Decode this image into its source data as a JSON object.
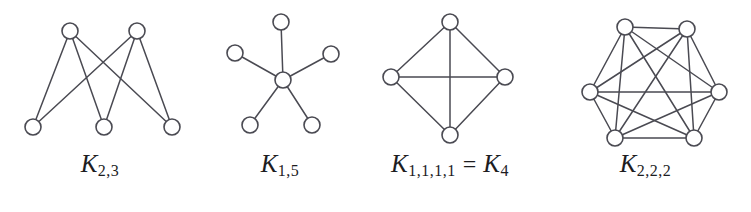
{
  "figure": {
    "background_color": "#ffffff",
    "stroke_color": "#4a4a52",
    "vertex_fill": "#ffffff",
    "label_color": "#1d1d1f",
    "graphs": [
      {
        "id": "k-2-3",
        "name": "complete-bipartite-2-3",
        "label_main": "K",
        "label_sub": "2,3",
        "label_full": "K_{2,3}",
        "vertex_count": 6,
        "edge_count": 6,
        "radius": 8,
        "vertices": [
          {
            "id": "t1",
            "x": 70,
            "y": 31
          },
          {
            "id": "t2",
            "x": 137,
            "y": 31
          },
          {
            "id": "b1",
            "x": 33,
            "y": 127
          },
          {
            "id": "b2",
            "x": 104,
            "y": 127
          },
          {
            "id": "b3",
            "x": 172,
            "y": 127
          }
        ],
        "edges": [
          [
            "t1",
            "b1"
          ],
          [
            "t1",
            "b2"
          ],
          [
            "t1",
            "b3"
          ],
          [
            "t2",
            "b1"
          ],
          [
            "t2",
            "b2"
          ],
          [
            "t2",
            "b3"
          ]
        ]
      },
      {
        "id": "k-1-5",
        "name": "star-1-5",
        "label_main": "K",
        "label_sub": "1,5",
        "label_full": "K_{1,5}",
        "vertex_count": 6,
        "edge_count": 5,
        "radius": 8,
        "vertices": [
          {
            "id": "c",
            "x": 283,
            "y": 80
          },
          {
            "id": "o1",
            "x": 281,
            "y": 22
          },
          {
            "id": "o2",
            "x": 235,
            "y": 53
          },
          {
            "id": "o3",
            "x": 331,
            "y": 54
          },
          {
            "id": "o4",
            "x": 250,
            "y": 125
          },
          {
            "id": "o5",
            "x": 312,
            "y": 125
          }
        ],
        "edges": [
          [
            "c",
            "o1"
          ],
          [
            "c",
            "o2"
          ],
          [
            "c",
            "o3"
          ],
          [
            "c",
            "o4"
          ],
          [
            "c",
            "o5"
          ]
        ]
      },
      {
        "id": "k-1-1-1-1",
        "name": "complete-graph-4",
        "label_main": "K",
        "label_sub": "1,1,1,1",
        "label_eq": "=",
        "label_main2": "K",
        "label_sub2": "4",
        "label_full": "K_{1,1,1,1} = K_4",
        "vertex_count": 4,
        "edge_count": 6,
        "radius": 8,
        "vertices": [
          {
            "id": "n",
            "x": 450,
            "y": 22
          },
          {
            "id": "w",
            "x": 391,
            "y": 77
          },
          {
            "id": "e",
            "x": 505,
            "y": 77
          },
          {
            "id": "s",
            "x": 450,
            "y": 135
          }
        ],
        "edges": [
          [
            "n",
            "w"
          ],
          [
            "n",
            "e"
          ],
          [
            "s",
            "w"
          ],
          [
            "s",
            "e"
          ],
          [
            "w",
            "e"
          ],
          [
            "n",
            "s"
          ]
        ]
      },
      {
        "id": "k-2-2-2",
        "name": "octahedron-2-2-2",
        "label_main": "K",
        "label_sub": "2,2,2",
        "label_full": "K_{2,2,2}",
        "vertex_count": 6,
        "edge_count": 12,
        "radius": 8,
        "vertices": [
          {
            "id": "tl",
            "x": 625,
            "y": 27
          },
          {
            "id": "tr",
            "x": 687,
            "y": 29
          },
          {
            "id": "ml",
            "x": 590,
            "y": 92
          },
          {
            "id": "mr",
            "x": 719,
            "y": 92
          },
          {
            "id": "bl",
            "x": 615,
            "y": 138
          },
          {
            "id": "br",
            "x": 694,
            "y": 138
          }
        ],
        "edges": [
          [
            "tl",
            "tr"
          ],
          [
            "tl",
            "ml"
          ],
          [
            "tl",
            "mr"
          ],
          [
            "tl",
            "bl"
          ],
          [
            "tl",
            "br"
          ],
          [
            "tr",
            "ml"
          ],
          [
            "tr",
            "mr"
          ],
          [
            "tr",
            "bl"
          ],
          [
            "tr",
            "br"
          ],
          [
            "ml",
            "bl"
          ],
          [
            "ml",
            "br"
          ],
          [
            "ml",
            "mr"
          ],
          [
            "mr",
            "bl"
          ],
          [
            "mr",
            "br"
          ],
          [
            "bl",
            "br"
          ]
        ]
      }
    ]
  }
}
